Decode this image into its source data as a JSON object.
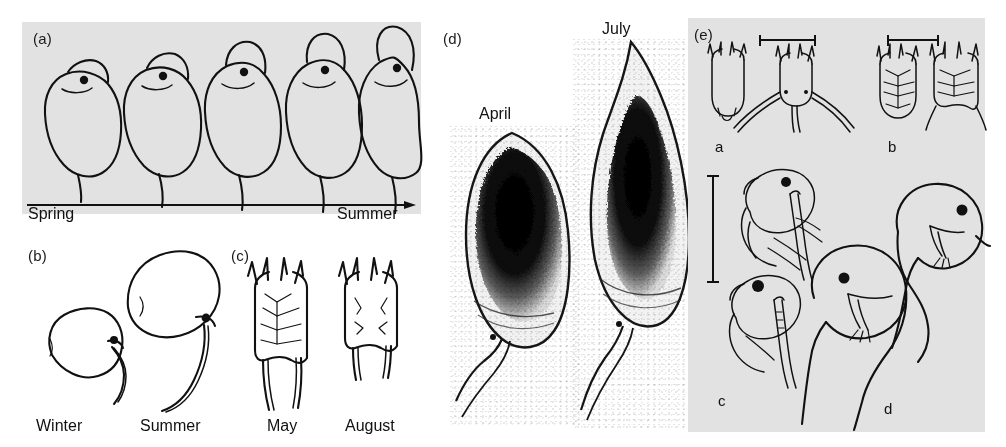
{
  "figure": {
    "background_color": "#ffffff",
    "panel_background_color": "#e2e2e2",
    "ink_color": "#111111"
  },
  "panels": [
    {
      "id": "a",
      "label": "(a)",
      "caption_left": "Spring",
      "caption_right": "Summer",
      "organism": "Daphnia",
      "description": "Five Daphnia outlines showing progressive helmet elongation from spring to summer",
      "axis": {
        "type": "arrow",
        "direction": "left-to-right"
      },
      "specimens": [
        {
          "index": 1,
          "season_position": "Spring",
          "helmet": "none",
          "relative_height": 1.0
        },
        {
          "index": 2,
          "season_position": "early",
          "helmet": "slight",
          "relative_height": 1.12
        },
        {
          "index": 3,
          "season_position": "mid",
          "helmet": "moderate",
          "relative_height": 1.24
        },
        {
          "index": 4,
          "season_position": "late",
          "helmet": "tall",
          "relative_height": 1.34
        },
        {
          "index": 5,
          "season_position": "Summer",
          "helmet": "very tall",
          "relative_height": 1.48
        }
      ]
    },
    {
      "id": "b",
      "label": "(b)",
      "organism": "Bosmina",
      "specimens": [
        {
          "label": "Winter",
          "form": "compact rounded body with short antennule"
        },
        {
          "label": "Summer",
          "form": "elongated body with long curved antennule"
        }
      ]
    },
    {
      "id": "c",
      "label": "(c)",
      "organism": "Keratella",
      "specimens": [
        {
          "label": "May",
          "form": "reticulated lorica, long posterior spines"
        },
        {
          "label": "August",
          "form": "reduced pattern, short posterior spines"
        }
      ]
    },
    {
      "id": "d",
      "label": "(d)",
      "organism": "Daphnia photomicrographs",
      "specimens": [
        {
          "label": "April",
          "form": "rounded head, short tail spine"
        },
        {
          "label": "July",
          "form": "pointed elongated helmet, long tail spine"
        }
      ]
    },
    {
      "id": "e",
      "label": "(e)",
      "sub_panels": [
        {
          "label": "a",
          "organism": "Keratella",
          "forms": [
            "spineless form",
            "long lateral spined form"
          ],
          "scalebar": "horizontal"
        },
        {
          "label": "b",
          "organism": "Keratella",
          "forms": [
            "rounded lorica",
            "spined lorica"
          ],
          "scalebar": "horizontal"
        },
        {
          "label": "c",
          "organism": "Bosmina",
          "forms": [
            "short antennule form",
            "long antennule form"
          ],
          "scalebar": "vertical"
        },
        {
          "label": "d",
          "organism": "Daphnia",
          "forms": [
            "round-headed form",
            "helmeted form"
          ],
          "scalebar": "none"
        }
      ]
    }
  ]
}
